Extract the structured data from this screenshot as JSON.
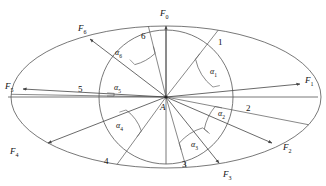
{
  "figure": {
    "type": "geometric-diagram",
    "center_label": "A",
    "stroke_color": "#555555",
    "background": "#ffffff",
    "canvas": {
      "width": 326,
      "height": 186
    },
    "ellipse": {
      "cx": 166,
      "cy": 97,
      "rx": 155,
      "ry": 71
    },
    "circle": {
      "cx": 166,
      "cy": 97,
      "r": 67
    }
  },
  "forces": [
    {
      "id": "F0",
      "base": "F",
      "sub": "0",
      "label_x": 160,
      "label_y": 9,
      "tip_x": 166,
      "tip_y": 26,
      "angle_deg": 90
    },
    {
      "id": "F1",
      "base": "F",
      "sub": "1",
      "label_x": 305,
      "label_y": 76,
      "tip_x": 300,
      "tip_y": 84,
      "angle_deg": 12
    },
    {
      "id": "F2",
      "base": "F",
      "sub": "2",
      "label_x": 283,
      "label_y": 143,
      "tip_x": 272,
      "tip_y": 143,
      "angle_deg": -40
    },
    {
      "id": "F3",
      "base": "F",
      "sub": "3",
      "label_x": 223,
      "label_y": 170,
      "tip_x": 219,
      "tip_y": 163,
      "angle_deg": -68
    },
    {
      "id": "F4",
      "base": "F",
      "sub": "4",
      "label_x": 10,
      "label_y": 147,
      "tip_x": 48,
      "tip_y": 143,
      "angle_deg": -162
    },
    {
      "id": "F5",
      "base": "F",
      "sub": "5",
      "label_x": 5,
      "label_y": 82,
      "tip_x": 23,
      "tip_y": 89,
      "angle_deg": 176
    },
    {
      "id": "F6",
      "base": "F",
      "sub": "6",
      "label_x": 78,
      "label_y": 24,
      "tip_x": 90,
      "tip_y": 39,
      "angle_deg": 134
    }
  ],
  "rays": [
    {
      "id": "ray1",
      "label": "1",
      "label_x": 218,
      "label_y": 38,
      "angle_deg": 52
    },
    {
      "id": "ray2",
      "label": "2",
      "label_x": 246,
      "label_y": 104,
      "angle_deg": -11
    },
    {
      "id": "ray3",
      "label": "3",
      "label_x": 182,
      "label_y": 160,
      "angle_deg": -74
    },
    {
      "id": "ray4",
      "label": "4",
      "label_x": 104,
      "label_y": 157,
      "angle_deg": -126
    },
    {
      "id": "ray5",
      "label": "5",
      "label_x": 78,
      "label_y": 85,
      "angle_deg": 179
    },
    {
      "id": "ray6",
      "label": "6",
      "label_x": 141,
      "label_y": 32,
      "angle_deg": 104
    }
  ],
  "angles": [
    {
      "id": "a1",
      "base": "α",
      "sub": "1",
      "label_x": 210,
      "label_y": 68,
      "from_deg": 12,
      "to_deg": 52,
      "arc_r": 48
    },
    {
      "id": "a2",
      "base": "α",
      "sub": "2",
      "label_x": 218,
      "label_y": 110,
      "from_deg": -40,
      "to_deg": -11,
      "arc_r": 50
    },
    {
      "id": "a3",
      "base": "α",
      "sub": "3",
      "label_x": 191,
      "label_y": 141,
      "from_deg": -74,
      "to_deg": -40,
      "arc_r": 48
    },
    {
      "id": "a4",
      "base": "α",
      "sub": "4",
      "label_x": 116,
      "label_y": 122,
      "from_deg": -162,
      "to_deg": -126,
      "arc_r": 42
    },
    {
      "id": "a5",
      "base": "α",
      "sub": "5",
      "label_x": 114,
      "label_y": 84,
      "from_deg": 176,
      "to_deg": 179,
      "arc_r": 52
    },
    {
      "id": "a6",
      "base": "α",
      "sub": "6",
      "label_x": 115,
      "label_y": 49,
      "from_deg": 104,
      "to_deg": 134,
      "arc_r": 45
    }
  ],
  "center_point": {
    "label": "A",
    "label_x": 160,
    "label_y": 103,
    "x": 166,
    "y": 97
  }
}
